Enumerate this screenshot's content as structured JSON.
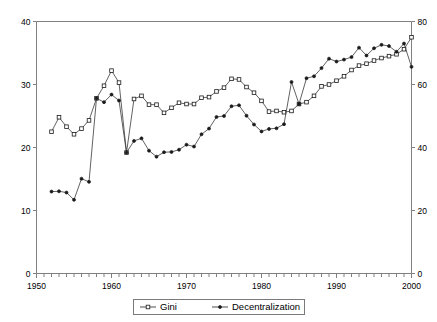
{
  "chart_data": {
    "type": "line",
    "title": "",
    "subtitle": "",
    "xlabel": "",
    "ylabel": "",
    "y2label": "",
    "grid": false,
    "legend_position": "bottom",
    "xlim": [
      1950,
      2000
    ],
    "ylim": [
      0,
      40
    ],
    "y2lim": [
      0,
      80
    ],
    "x_ticks_major": [
      1950,
      1960,
      1970,
      1980,
      1990,
      2000
    ],
    "x_tick_labels": [
      "1950",
      "1960",
      "1970",
      "1980",
      "1990",
      "2000"
    ],
    "x_tick_minor_step": 1,
    "y_ticks": [
      0,
      10,
      20,
      30,
      40
    ],
    "y_tick_labels": [
      "0",
      "10",
      "20",
      "30",
      "40"
    ],
    "y2_ticks": [
      0,
      20,
      40,
      60,
      80
    ],
    "y2_tick_labels": [
      "0",
      "20",
      "40",
      "60",
      "80"
    ],
    "series": [
      {
        "name": "Gini",
        "axis": "left",
        "marker": "open-square",
        "x": [
          1952,
          1953,
          1954,
          1955,
          1956,
          1957,
          1958,
          1959,
          1960,
          1961,
          1962,
          1963,
          1964,
          1965,
          1966,
          1967,
          1968,
          1969,
          1970,
          1971,
          1972,
          1973,
          1974,
          1975,
          1976,
          1977,
          1978,
          1979,
          1980,
          1981,
          1982,
          1983,
          1984,
          1985,
          1986,
          1987,
          1988,
          1989,
          1990,
          1991,
          1992,
          1993,
          1994,
          1995,
          1996,
          1997,
          1998,
          1999,
          2000
        ],
        "values": [
          22.5,
          24.8,
          23.3,
          22.1,
          23.0,
          24.3,
          27.8,
          29.8,
          32.2,
          30.3,
          19.2,
          27.7,
          28.2,
          26.8,
          26.8,
          25.5,
          26.3,
          27.1,
          26.9,
          26.9,
          27.9,
          28.0,
          28.9,
          29.5,
          30.9,
          30.8,
          29.6,
          28.7,
          27.4,
          25.7,
          25.8,
          25.6,
          25.8,
          26.9,
          27.2,
          28.2,
          29.7,
          30.0,
          30.6,
          31.3,
          32.3,
          33.0,
          33.3,
          33.8,
          34.2,
          34.5,
          34.8,
          35.6,
          37.5
        ]
      },
      {
        "name": "Decentralization",
        "axis": "right",
        "marker": "filled",
        "x": [
          1952,
          1953,
          1954,
          1955,
          1956,
          1957,
          1958,
          1959,
          1960,
          1961,
          1962,
          1963,
          1964,
          1965,
          1966,
          1967,
          1968,
          1969,
          1970,
          1971,
          1972,
          1973,
          1974,
          1975,
          1976,
          1977,
          1978,
          1979,
          1980,
          1981,
          1982,
          1983,
          1984,
          1985,
          1986,
          1987,
          1988,
          1989,
          1990,
          1991,
          1992,
          1993,
          1994,
          1995,
          1996,
          1997,
          1998,
          1999,
          2000
        ],
        "values": [
          26.0,
          26.1,
          25.7,
          23.4,
          30.1,
          29.1,
          55.6,
          54.4,
          56.8,
          54.9,
          38.4,
          42.1,
          42.9,
          39.0,
          37.1,
          38.5,
          38.6,
          39.3,
          40.9,
          40.3,
          44.2,
          46.0,
          49.7,
          50.0,
          53.1,
          53.4,
          50.1,
          47.3,
          45.1,
          45.9,
          46.1,
          47.4,
          60.8,
          53.8,
          62.0,
          62.6,
          65.2,
          68.2,
          67.3,
          67.9,
          68.7,
          71.7,
          69.2,
          71.5,
          72.6,
          72.2,
          70.4,
          73.0,
          65.6
        ]
      }
    ]
  },
  "legend": {
    "items": [
      {
        "label": "Gini",
        "marker": "open-square"
      },
      {
        "label": "Decentralization",
        "marker": "filled-diamond"
      }
    ]
  }
}
